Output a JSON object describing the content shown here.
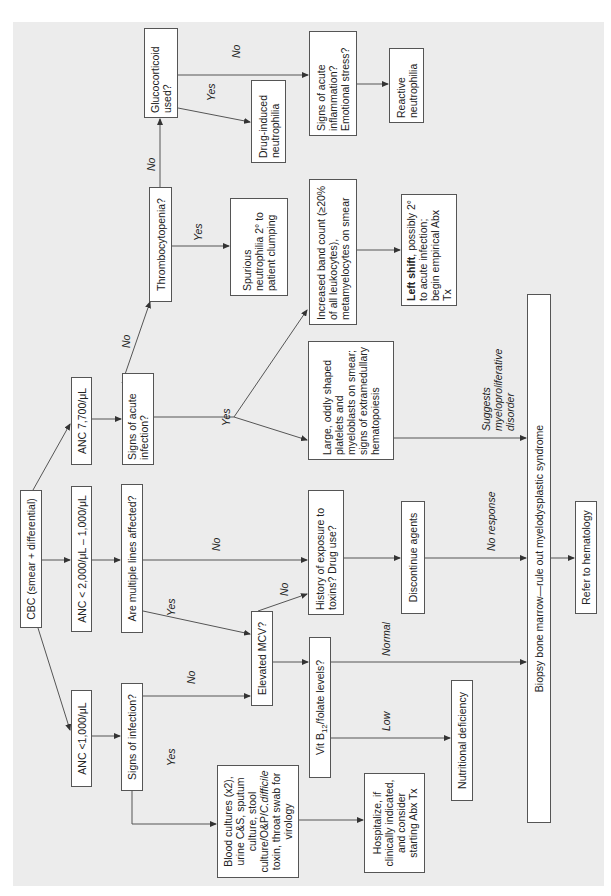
{
  "nodes": {
    "cbc": "CBC (smear + differential)",
    "anc_low": "ANC <1,000/μL",
    "anc_mid": "ANC < 2,000/μL – 1,000/μL",
    "anc_high": "ANC 7,700/μL",
    "signs_infection": "Signs of infection?",
    "multiple_lines": "Are multiple lines affected?",
    "signs_acute_infection": "Signs of acute infection?",
    "thrombocytopenia": "Thrombocytopenia?",
    "glucocorticoid": "Glucocorticoid used?",
    "drug_induced": "Drug-induced neutrophilia",
    "signs_inflammation": "Signs of acute inflammation? Emotional stress?",
    "reactive": "Reactive neutrophilia",
    "spurious": "Spurious neutrophilia 2° to patient clumping",
    "band_count": "Increased band count (≥20% of all leukocytes), metamyelocytes on smear",
    "left_shift_bold": "Left shift",
    "left_shift_rest": ", possibly 2° to acute infection; begin empirical Abx Tx",
    "large_platelets": "Large, oddly shaped platelets and myeloblasts on smear; signs of extramedullary hematopoiesis",
    "elevated_mcv": "Elevated MCV?",
    "history_exposure": "History of exposure to toxins? Drug use?",
    "discontinue": "Discontinue agents",
    "vit_b12_prefix": "Vit B",
    "vit_b12_sub": "12",
    "vit_b12_suffix": "/folate levels?",
    "nutritional": "Nutritional deficiency",
    "blood_cultures_1": "Blood cultures (x2), urine C&S, sputum culture, stool culture/O&P/",
    "blood_cultures_italic": "C.difficile",
    "blood_cultures_2": " toxin, throat swab for virology",
    "hospitalize": "Hospitalize, if clinically indicated, and consider starting Abx Tx",
    "biopsy": "Biopsy bone marrow—rule out myelodysplastic syndrome",
    "refer": "Refer to hematology"
  },
  "edge_labels": {
    "infection_yes": "Yes",
    "infection_no": "No",
    "multiple_yes": "Yes",
    "multiple_no": "No",
    "mcv_no": "No",
    "acute_yes": "Yes",
    "acute_no": "No",
    "thrombo_yes": "Yes",
    "thrombo_no": "No",
    "gluco_yes": "Yes",
    "gluco_no": "No",
    "b12_low": "Low",
    "b12_normal": "Normal",
    "no_response": "No response",
    "suggests": "Suggests myeloproliferative disorder"
  },
  "colors": {
    "panel": "#ececec",
    "box": "#ffffff",
    "line": "#555555"
  }
}
